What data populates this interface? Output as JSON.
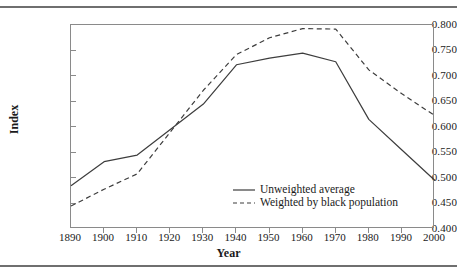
{
  "figure": {
    "rule_top": "horizontal-rule",
    "rule_bottom": "horizontal-rule"
  },
  "chart_data": {
    "type": "line",
    "title": "",
    "xlabel": "Year",
    "ylabel": "Index",
    "x": [
      1890,
      1900,
      1910,
      1920,
      1930,
      1940,
      1950,
      1960,
      1970,
      1980,
      1990,
      2000
    ],
    "xlim": [
      1890,
      2000
    ],
    "ylim": [
      0.4,
      0.8
    ],
    "yticks": [
      0.4,
      0.45,
      0.5,
      0.55,
      0.6,
      0.65,
      0.7,
      0.75,
      0.8
    ],
    "ytick_labels": [
      "0.400",
      "0.450",
      "0.500",
      "0.550",
      "0.600",
      "0.650",
      "0.700",
      "0.750",
      "0.800"
    ],
    "xticks": [
      1890,
      1900,
      1910,
      1920,
      1930,
      1940,
      1950,
      1960,
      1970,
      1980,
      1990,
      2000
    ],
    "xtick_labels": [
      "1890",
      "1900",
      "1910",
      "1920",
      "1930",
      "1940",
      "1950",
      "1960",
      "1970",
      "1980",
      "1990",
      "2000"
    ],
    "grid": false,
    "legend_position": "lower-center",
    "series": [
      {
        "name": "Unweighted average",
        "style": "solid",
        "color": "#3d3d3d",
        "values": [
          0.485,
          0.532,
          0.545,
          0.595,
          0.645,
          0.722,
          0.735,
          0.745,
          0.728,
          0.615,
          0.555,
          0.495
        ]
      },
      {
        "name": "Weighted by black population",
        "style": "dashed",
        "color": "#3d3d3d",
        "values": [
          0.445,
          0.478,
          0.508,
          0.59,
          0.672,
          0.742,
          0.775,
          0.793,
          0.792,
          0.712,
          0.665,
          0.622
        ]
      }
    ]
  },
  "legend": {
    "entries": [
      {
        "label": "Unweighted average",
        "style": "solid"
      },
      {
        "label": "Weighted by black population",
        "style": "dashed"
      }
    ]
  }
}
